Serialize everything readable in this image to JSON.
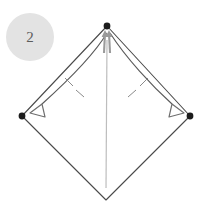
{
  "figure": {
    "kind": "origami-fold-diagram",
    "step_badge": {
      "label": "2",
      "background_color": "#e3e3e3",
      "text_color": "#5c5c5c"
    },
    "background_color": "#ffffff",
    "colors": {
      "outline": "#4a4a4a",
      "crease_line": "#bdbdbd",
      "vertex_dot": "#1c1c1c",
      "arrow_curve": "#5a5a5a",
      "arrow_head_outline": "#6e6e6e",
      "tick_mark": "#8a8a8a",
      "apex_arrow": "#9a9a9a"
    },
    "vertices": [
      {
        "name": "top",
        "x": 107,
        "y": 26,
        "dot": true
      },
      {
        "name": "left",
        "x": 22,
        "y": 116,
        "dot": true
      },
      {
        "name": "right",
        "x": 190,
        "y": 116,
        "dot": true
      },
      {
        "name": "bottom",
        "x": 106,
        "y": 200,
        "dot": false
      }
    ],
    "outline_path": "M107,26 L22,116 L106,200 L190,116 Z",
    "center_crease": {
      "x1": 107,
      "y1": 40,
      "x2": 106,
      "y2": 188
    },
    "fold_arrows": [
      {
        "name": "left-fold-arrow",
        "direction": "from-apex-to-left-vertex",
        "curve": "M107,33 C 92,58 62,86 42,104",
        "head_points": "42,104 30,113 45,117",
        "ticks": [
          {
            "x1": 65,
            "y1": 78,
            "x2": 73,
            "y2": 86
          },
          {
            "x1": 76,
            "y1": 90,
            "x2": 84,
            "y2": 97
          }
        ]
      },
      {
        "name": "right-fold-arrow",
        "direction": "from-apex-to-right-vertex",
        "curve": "M110,33 C 126,58 152,86 172,104",
        "head_points": "172,104 184,113 169,117",
        "ticks": [
          {
            "x1": 148,
            "y1": 78,
            "x2": 140,
            "y2": 86
          },
          {
            "x1": 136,
            "y1": 90,
            "x2": 128,
            "y2": 97
          }
        ]
      }
    ],
    "apex_arrows": [
      {
        "name": "apex-arrow-left",
        "x1": 104,
        "y1": 53,
        "x2": 105,
        "y2": 33
      },
      {
        "name": "apex-arrow-right",
        "x1": 110,
        "y1": 53,
        "x2": 109,
        "y2": 33
      }
    ]
  }
}
